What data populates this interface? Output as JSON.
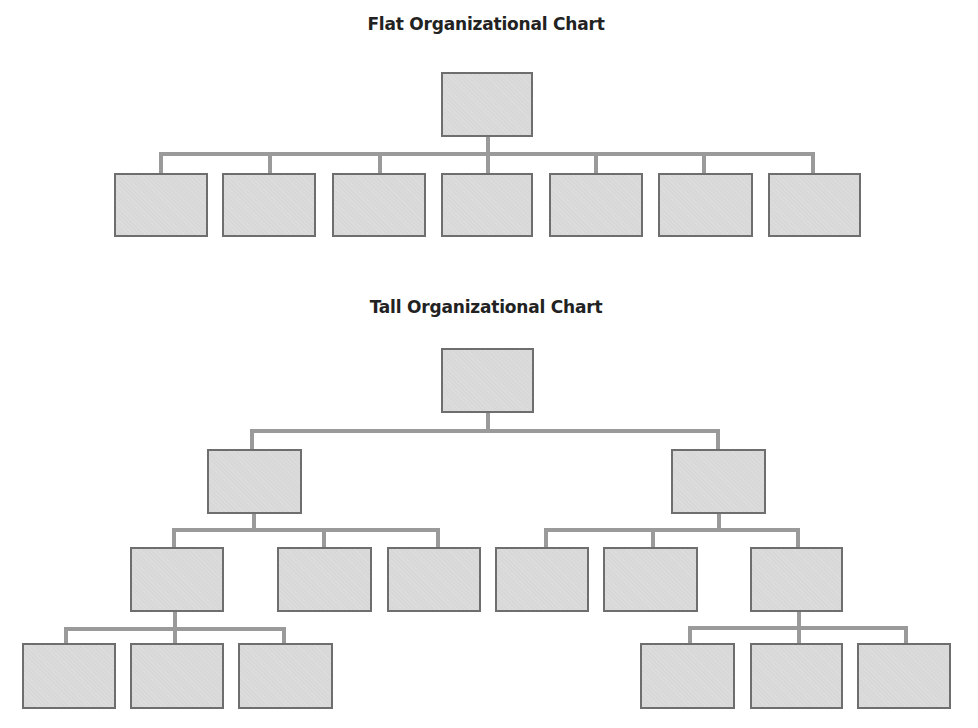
{
  "charts": [
    {
      "title": "Flat Organizational Chart",
      "title_pos": [
        486,
        14
      ],
      "boxes": [
        [
          441,
          72,
          92,
          65
        ],
        [
          114,
          173,
          94,
          64
        ],
        [
          222,
          173,
          94,
          64
        ],
        [
          332,
          173,
          94,
          64
        ],
        [
          441,
          173,
          92,
          64
        ],
        [
          549,
          173,
          94,
          64
        ],
        [
          658,
          173,
          95,
          64
        ],
        [
          768,
          173,
          93,
          64
        ]
      ],
      "lines": [
        [
          486,
          137,
          4,
          17
        ],
        [
          159,
          152,
          656,
          4
        ],
        [
          159,
          154,
          4,
          19
        ],
        [
          268,
          154,
          4,
          19
        ],
        [
          378,
          154,
          4,
          19
        ],
        [
          486,
          154,
          4,
          19
        ],
        [
          594,
          154,
          4,
          19
        ],
        [
          702,
          154,
          4,
          19
        ],
        [
          811,
          154,
          4,
          19
        ]
      ]
    },
    {
      "title": "Tall Organizational Chart",
      "title_pos": [
        486,
        297
      ],
      "boxes": [
        [
          441,
          348,
          93,
          65
        ],
        [
          207,
          449,
          95,
          65
        ],
        [
          671,
          449,
          95,
          65
        ],
        [
          130,
          547,
          94,
          65
        ],
        [
          277,
          547,
          95,
          65
        ],
        [
          387,
          547,
          94,
          65
        ],
        [
          495,
          547,
          94,
          65
        ],
        [
          603,
          547,
          95,
          65
        ],
        [
          750,
          547,
          93,
          65
        ],
        [
          22,
          643,
          94,
          66
        ],
        [
          130,
          643,
          94,
          66
        ],
        [
          238,
          643,
          95,
          66
        ],
        [
          640,
          643,
          95,
          66
        ],
        [
          750,
          643,
          93,
          66
        ],
        [
          857,
          643,
          94,
          66
        ]
      ],
      "lines": [
        [
          486,
          413,
          4,
          18
        ],
        [
          250,
          429,
          470,
          4
        ],
        [
          250,
          431,
          4,
          18
        ],
        [
          716,
          431,
          4,
          18
        ],
        [
          252,
          514,
          4,
          16
        ],
        [
          172,
          528,
          268,
          4
        ],
        [
          172,
          530,
          4,
          17
        ],
        [
          322,
          530,
          4,
          17
        ],
        [
          436,
          530,
          4,
          17
        ],
        [
          717,
          514,
          4,
          16
        ],
        [
          544,
          528,
          256,
          4
        ],
        [
          544,
          530,
          4,
          17
        ],
        [
          651,
          530,
          4,
          17
        ],
        [
          796,
          530,
          4,
          17
        ],
        [
          173,
          612,
          4,
          16
        ],
        [
          64,
          627,
          222,
          4
        ],
        [
          64,
          629,
          4,
          14
        ],
        [
          173,
          629,
          4,
          14
        ],
        [
          282,
          629,
          4,
          14
        ],
        [
          797,
          612,
          4,
          16
        ],
        [
          688,
          626,
          220,
          4
        ],
        [
          688,
          628,
          4,
          15
        ],
        [
          797,
          628,
          4,
          15
        ],
        [
          904,
          628,
          4,
          15
        ]
      ]
    }
  ],
  "colors": {
    "box_fill": "#d8d8d8",
    "box_border": "#6e6e6e",
    "connector": "#9a9a9a",
    "title": "#222222"
  }
}
